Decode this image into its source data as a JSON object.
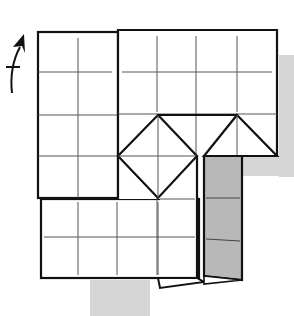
{
  "diagram": {
    "title": "Origami folding step",
    "arrow_icon": "curved-fold-arrow-up",
    "colors": {
      "background": "#ffffff",
      "paper": "#ffffff",
      "line": "#111111",
      "crease": "#555555",
      "shaded_flap": "#b8b8b8",
      "shadow": "#d6d6d6"
    },
    "grid": {
      "cell_size_px": 39
    }
  }
}
